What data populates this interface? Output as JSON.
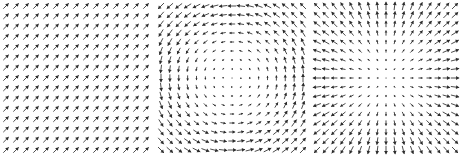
{
  "figure": {
    "title": "",
    "width": 461,
    "height": 156,
    "background_color": "#ffffff",
    "arrow_color": "#2b2b2b",
    "panel_count": 3
  },
  "chart_data": [
    {
      "type": "scatter",
      "subtype": "quiver",
      "name": "uniform-field",
      "title": "",
      "xlabel": "",
      "ylabel": "",
      "xlim": [
        -1,
        1
      ],
      "ylim": [
        -1,
        1
      ],
      "grid": false,
      "legend": "none",
      "field_formula": "F(x,y) = (1, 1)",
      "description": "Uniform vector field: every arrow has identical magnitude and points up and to the right at 45 degrees.",
      "grid_cols": 15,
      "grid_rows": 15,
      "arrow_angle_deg": 45,
      "arrow_magnitude": 1.0,
      "divergence": 0,
      "curl": 0
    },
    {
      "type": "scatter",
      "subtype": "quiver",
      "name": "rotational-field",
      "title": "",
      "xlabel": "",
      "ylabel": "",
      "xlim": [
        -1,
        1
      ],
      "ylim": [
        -1,
        1
      ],
      "grid": false,
      "legend": "none",
      "field_formula": "F(x,y) = (-y, x)",
      "description": "Rotational (curl) vector field: arrows circulate about the centre counterclockwise in math coordinates; magnitude grows with distance from centre, arrows near centre are near zero length.",
      "grid_cols": 17,
      "grid_rows": 17,
      "center": [
        0,
        0
      ],
      "rotation_sense": "counterclockwise",
      "magnitude_rule": "proportional to radius",
      "divergence": 0,
      "curl": 2
    },
    {
      "type": "scatter",
      "subtype": "quiver",
      "name": "divergent-field",
      "title": "",
      "xlabel": "",
      "ylabel": "",
      "xlim": [
        -1,
        1
      ],
      "ylim": [
        -1,
        1
      ],
      "grid": false,
      "legend": "none",
      "field_formula": "F(x,y) = (x, y)",
      "description": "Radial (divergence) vector field: arrows point outward from the centre like a source; magnitude grows with distance from centre.",
      "grid_cols": 17,
      "grid_rows": 17,
      "center": [
        0,
        0
      ],
      "radial_sense": "outward",
      "magnitude_rule": "proportional to radius",
      "divergence": 2,
      "curl": 0
    }
  ]
}
